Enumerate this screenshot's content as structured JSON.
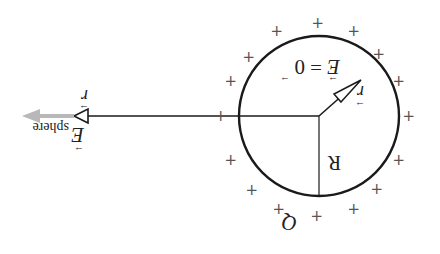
{
  "diagram": {
    "orientation": "rotated-180",
    "labels": {
      "inside_field": "E = 0",
      "inside_field_vec_E": "E",
      "inside_field_eq": "= 0",
      "radius_vector": "r",
      "radius": "R",
      "charge": "Q",
      "field_main": "E",
      "field_sub": "sphere",
      "outer_r": "r"
    },
    "colors": {
      "stroke": "#1a1a1a",
      "plus": "#555555",
      "field_arrow": "#b8b8b8"
    },
    "plus_symbol": "+"
  }
}
